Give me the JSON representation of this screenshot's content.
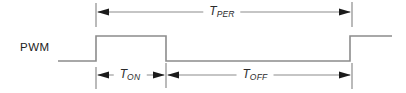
{
  "diagram": {
    "signal_label": "PWM",
    "dimensions": {
      "period": {
        "main": "T",
        "sub": "PER"
      },
      "on": {
        "main": "T",
        "sub": "ON"
      },
      "off": {
        "main": "T",
        "sub": "OFF"
      }
    },
    "colors": {
      "line": "#8c8c8c",
      "arrow": "#1b1b1b",
      "text": "#2b2b2b",
      "background": "#ffffff"
    }
  }
}
